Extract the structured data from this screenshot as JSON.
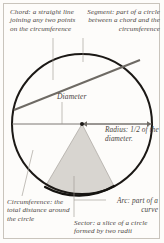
{
  "diagram": {
    "captions": {
      "chord": "Chord: a straight line joining any two points on the circumference",
      "segment": "Segment: part of a circle between a chord and the circumference",
      "diameter": "Diameter",
      "radius": "Radius: 1/2 of the diameter.",
      "circumference": "Circumference: the total distance around the circle",
      "arc": "Arc: part of a curve",
      "sector": "Sector: a slice of a circle formed by two radii"
    },
    "colors": {
      "page_background": "#fdfcfa",
      "frame_border": "#c9c4bc",
      "circle_stroke": "#1b1815",
      "chord_stroke": "#6e6a64",
      "leader_line": "#9a958d",
      "sector_fill": "#d8d5d0",
      "sector_stroke": "#a8a49e",
      "text": "#4a453f"
    },
    "geometry": {
      "circle_center_x": 82,
      "circle_center_y": 124,
      "circle_radius": 70,
      "circle_stroke_width": 2.0,
      "diameter_y": 124,
      "center_dot_radius": 2.0,
      "chord_start_x": 14,
      "chord_start_y": 110,
      "chord_end_x": 140,
      "chord_end_y": 60,
      "sector_left_x": 45,
      "sector_left_y": 187,
      "sector_right_x": 114,
      "sector_right_y": 186
    }
  }
}
